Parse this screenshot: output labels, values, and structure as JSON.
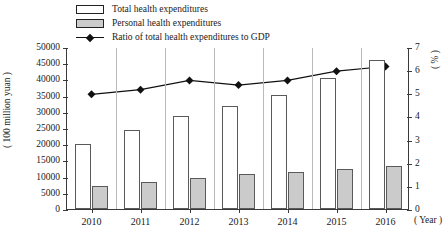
{
  "chart_data": {
    "type": "bar",
    "title": "",
    "xlabel": "( Year )",
    "ylabel": "( 100 million yuan )",
    "y2label": "( % )",
    "categories": [
      "2010",
      "2011",
      "2012",
      "2013",
      "2014",
      "2015",
      "2016"
    ],
    "ylim": [
      0,
      50000
    ],
    "yticks": [
      0,
      5000,
      10000,
      15000,
      20000,
      25000,
      30000,
      35000,
      40000,
      45000,
      50000
    ],
    "y2lim": [
      0,
      7
    ],
    "y2ticks": [
      0,
      1,
      2,
      3,
      4,
      5,
      6,
      7
    ],
    "grid": "vertical",
    "legend_position": "top-center",
    "series": [
      {
        "name": "Total health expenditures",
        "type": "bar",
        "axis": "left",
        "color": "#ffffff",
        "values": [
          20000,
          24500,
          28800,
          31700,
          35300,
          40500,
          46000
        ]
      },
      {
        "name": "Personal health expenditures",
        "type": "bar",
        "axis": "left",
        "color": "#cbcbcb",
        "values": [
          7000,
          8300,
          9700,
          10700,
          11300,
          12200,
          13300
        ]
      },
      {
        "name": "Ratio of total health expenditures to GDP",
        "type": "line",
        "axis": "right",
        "color": "#111111",
        "values": [
          5.0,
          5.2,
          5.6,
          5.4,
          5.6,
          6.0,
          6.2
        ]
      }
    ]
  },
  "legend": {
    "items": [
      {
        "label": "Total health expenditures",
        "icon": "white-square-swatch"
      },
      {
        "label": "Personal health expenditures",
        "icon": "gray-square-swatch"
      },
      {
        "label": "Ratio of total health expenditures to GDP",
        "icon": "line-diamond-marker"
      }
    ]
  }
}
